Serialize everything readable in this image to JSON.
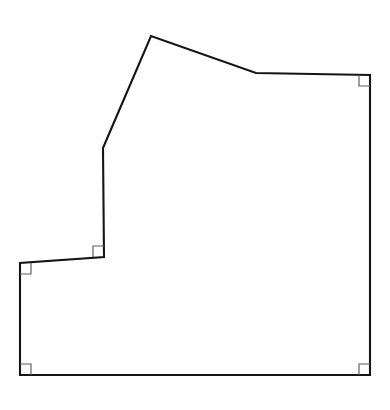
{
  "figure": {
    "name": "polygon-floor-plan-outline",
    "background_color": "#ffffff",
    "outline_color": "#151515",
    "outline_width_px": 2.1,
    "fill_color": "#ffffff",
    "canvas": {
      "width": 390,
      "height": 410
    },
    "vertices": [
      {
        "id": "apex",
        "label": "apex-peak",
        "x": 151,
        "y": 36
      },
      {
        "id": "ridge-bend",
        "label": "roof-bend",
        "x": 256,
        "y": 73
      },
      {
        "id": "top-right",
        "label": "top-right-corner",
        "x": 370,
        "y": 75
      },
      {
        "id": "bottom-right",
        "label": "bottom-right-corner",
        "x": 370,
        "y": 375
      },
      {
        "id": "bottom-left",
        "label": "bottom-left-corner",
        "x": 20,
        "y": 375
      },
      {
        "id": "step-left-top",
        "label": "notch-outer-corner",
        "x": 20,
        "y": 263
      },
      {
        "id": "step-inner",
        "label": "notch-inner-corner",
        "x": 104,
        "y": 257
      },
      {
        "id": "slant-base",
        "label": "slope-base",
        "x": 103,
        "y": 148
      }
    ],
    "edges": [
      {
        "name": "left-roof-slope",
        "from": "slant-base",
        "to": "apex",
        "kind": "slanted"
      },
      {
        "name": "right-roof-slope",
        "from": "apex",
        "to": "ridge-bend",
        "kind": "slanted"
      },
      {
        "name": "upper-top-edge",
        "from": "ridge-bend",
        "to": "top-right",
        "kind": "horizontal"
      },
      {
        "name": "right-edge",
        "from": "top-right",
        "to": "bottom-right",
        "kind": "vertical"
      },
      {
        "name": "bottom-edge",
        "from": "bottom-right",
        "to": "bottom-left",
        "kind": "horizontal"
      },
      {
        "name": "lower-left-edge",
        "from": "bottom-left",
        "to": "step-left-top",
        "kind": "vertical"
      },
      {
        "name": "notch-horizontal-edge",
        "from": "step-left-top",
        "to": "step-inner",
        "kind": "horizontal"
      },
      {
        "name": "notch-vertical-edge",
        "from": "step-inner",
        "to": "slant-base",
        "kind": "vertical"
      }
    ],
    "right_angle_markers": [
      {
        "name": "right-angle-marker-top-right",
        "at_vertex": "top-right",
        "x": 370,
        "y": 75,
        "dx": -1,
        "dy": 1,
        "size_px": 11
      },
      {
        "name": "right-angle-marker-bottom-right",
        "at_vertex": "bottom-right",
        "x": 370,
        "y": 375,
        "dx": -1,
        "dy": -1,
        "size_px": 11
      },
      {
        "name": "right-angle-marker-bottom-left",
        "at_vertex": "bottom-left",
        "x": 20,
        "y": 375,
        "dx": 1,
        "dy": -1,
        "size_px": 11
      },
      {
        "name": "right-angle-marker-notch-outer",
        "at_vertex": "step-left-top",
        "x": 20,
        "y": 263,
        "dx": 1,
        "dy": 1,
        "size_px": 11
      },
      {
        "name": "right-angle-marker-notch-inner",
        "at_vertex": "step-inner",
        "x": 104,
        "y": 257,
        "dx": -1,
        "dy": -1,
        "size_px": 11
      }
    ],
    "marker_style": {
      "stroke_color": "#5b5b5b",
      "stroke_width_px": 1.15,
      "fill": "none"
    }
  }
}
